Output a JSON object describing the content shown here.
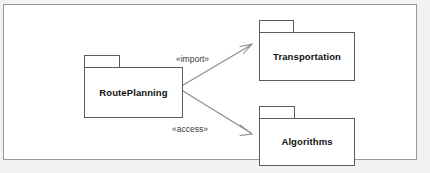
{
  "diagram": {
    "type": "uml-package-diagram",
    "frame": {
      "border_color": "#9a9a9a",
      "background_color": "#ffffff",
      "canvas_color": "#f2f2f2"
    },
    "packages": [
      {
        "id": "routeplanning",
        "label": "RoutePlanning",
        "role": "source"
      },
      {
        "id": "transportation",
        "label": "Transportation",
        "role": "target"
      },
      {
        "id": "algorithms",
        "label": "Algorithms",
        "role": "target"
      }
    ],
    "dependencies": [
      {
        "id": "import",
        "stereotype": "«import»",
        "from": "RoutePlanning",
        "to": "Transportation",
        "arrow": "open",
        "line": "solid"
      },
      {
        "id": "access",
        "stereotype": "«access»",
        "from": "RoutePlanning",
        "to": "Algorithms",
        "arrow": "open",
        "line": "solid"
      }
    ],
    "colors": {
      "package_border": "#5a5a5a",
      "package_fill": "#ffffff",
      "edge": "#8a8a8a",
      "label_text": "#111111",
      "stereotype_text": "#3a3a3a"
    }
  }
}
